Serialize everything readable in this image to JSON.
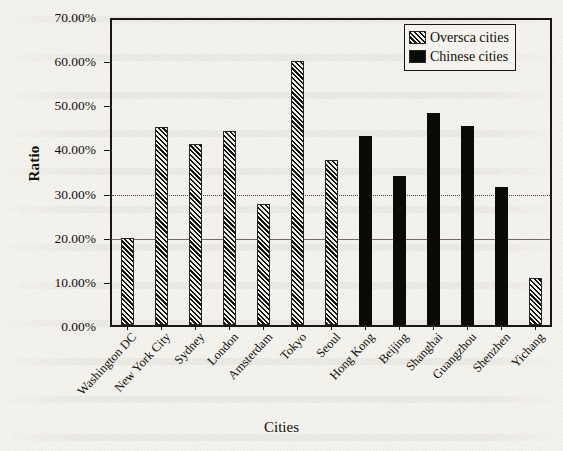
{
  "chart_data": {
    "type": "bar",
    "title": "",
    "xlabel": "Cities",
    "ylabel": "Ratio",
    "ylim": [
      0,
      70
    ],
    "ytick_labels": [
      "0.00%",
      "10.00%",
      "20.00%",
      "30.00%",
      "40.00%",
      "50.00%",
      "60.00%",
      "70.00%"
    ],
    "ytick_values": [
      0,
      10,
      20,
      30,
      40,
      50,
      60,
      70
    ],
    "gridlines": [
      {
        "value": 20,
        "style": "solid"
      },
      {
        "value": 30,
        "style": "dotted"
      }
    ],
    "grid": true,
    "legend_position": "top-right",
    "categories": [
      "Washington DC",
      "New York City",
      "Sydney",
      "London",
      "Amsterdam",
      "Tokyo",
      "Seoul",
      "Hong Kong",
      "Beijing",
      "Shanghai",
      "Guangzhou",
      "Shenzhen",
      "Yichang"
    ],
    "values": [
      20.2,
      45.4,
      41.4,
      44.3,
      27.8,
      60.2,
      37.8,
      43.2,
      34.2,
      48.5,
      45.6,
      31.8,
      11.2
    ],
    "groups": [
      "overseas",
      "overseas",
      "overseas",
      "overseas",
      "overseas",
      "overseas",
      "overseas",
      "chinese",
      "chinese",
      "chinese",
      "chinese",
      "chinese",
      "overseas"
    ],
    "series": [
      {
        "name": "Oversca cities",
        "key": "overseas",
        "pattern": "diagonal-hatch",
        "color": "#4e4a42",
        "points": [
          {
            "category": "Washington DC",
            "value": 20.2
          },
          {
            "category": "New York City",
            "value": 45.4
          },
          {
            "category": "Sydney",
            "value": 41.4
          },
          {
            "category": "London",
            "value": 44.3
          },
          {
            "category": "Amsterdam",
            "value": 27.8
          },
          {
            "category": "Tokyo",
            "value": 60.2
          },
          {
            "category": "Seoul",
            "value": 37.8
          },
          {
            "category": "Yichang",
            "value": 11.2
          }
        ]
      },
      {
        "name": "Chinese cities",
        "key": "chinese",
        "pattern": "solid",
        "color": "#0b0a08",
        "points": [
          {
            "category": "Hong Kong",
            "value": 43.2
          },
          {
            "category": "Beijing",
            "value": 34.2
          },
          {
            "category": "Shanghai",
            "value": 48.5
          },
          {
            "category": "Guangzhou",
            "value": 45.6
          },
          {
            "category": "Shenzhen",
            "value": 31.8
          }
        ]
      }
    ]
  },
  "legend": {
    "entries": [
      {
        "label": "Oversca cities",
        "key": "overseas"
      },
      {
        "label": "Chinese cities",
        "key": "chinese"
      }
    ]
  },
  "axes": {
    "y_title": "Ratio",
    "x_title": "Cities"
  }
}
